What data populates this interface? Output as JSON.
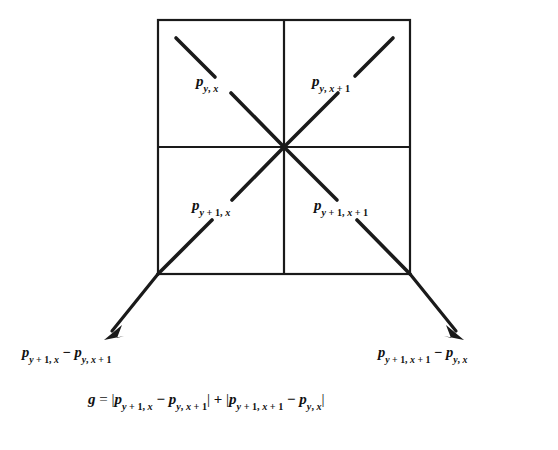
{
  "figure": {
    "stroke_color": "#1a1a1a",
    "background_color": "#ffffff",
    "grid": {
      "x": 158,
      "y": 20,
      "width": 252,
      "height": 254,
      "rows": 2,
      "cols": 2
    }
  },
  "cells": [
    {
      "name": "top-left",
      "base": "p",
      "sub_row": "y",
      "sub_col": "x",
      "text": "p y, x"
    },
    {
      "name": "top-right",
      "base": "p",
      "sub_row": "y",
      "sub_col": "x + 1",
      "text": "p y, x + 1"
    },
    {
      "name": "bottom-left",
      "base": "p",
      "sub_row": "y + 1",
      "sub_col": "x",
      "text": "p y + 1, x"
    },
    {
      "name": "bottom-right",
      "base": "p",
      "sub_row": "y + 1",
      "sub_col": "x + 1",
      "text": "p y + 1, x + 1"
    }
  ],
  "diff_labels": [
    {
      "name": "left",
      "minuend_sub": "y + 1, x",
      "subtrahend_sub": "y, x + 1",
      "text": "p y + 1, x  -  p y, x + 1"
    },
    {
      "name": "right",
      "minuend_sub": "y + 1, x + 1",
      "subtrahend_sub": "y, x",
      "text": "p y + 1, x + 1  -  p y, x"
    }
  ],
  "formula": {
    "symbol": "g",
    "equals": "=",
    "term1_minuend_sub": "y + 1, x",
    "term1_subtrahend_sub": "y, x + 1",
    "plus": "+",
    "term2_minuend_sub": "y + 1, x + 1",
    "term2_subtrahend_sub": "y, x",
    "text": "g = | p y + 1, x - p y, x + 1 | + | p y + 1, x + 1 - p y, x |"
  },
  "arrows": [
    {
      "name": "left-arrow",
      "from": [
        158,
        274
      ],
      "to": [
        106,
        337
      ]
    },
    {
      "name": "right-arrow",
      "from": [
        410,
        274
      ],
      "to": [
        462,
        337
      ]
    }
  ]
}
